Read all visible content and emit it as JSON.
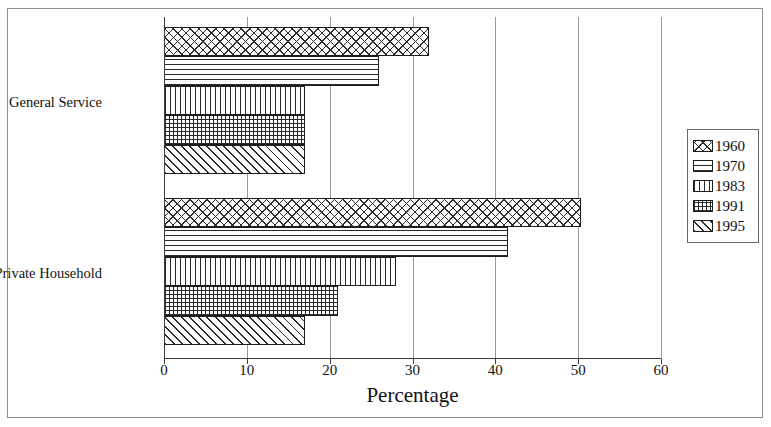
{
  "chart_data": {
    "type": "bar",
    "orientation": "horizontal",
    "title": "",
    "xlabel": "Percentage",
    "ylabel": "",
    "xlim": [
      0,
      60
    ],
    "xticks": [
      0,
      10,
      20,
      30,
      40,
      50,
      60
    ],
    "categories": [
      "General Service",
      "Private Household"
    ],
    "grid": true,
    "legend_position": "right",
    "series": [
      {
        "name": "1960",
        "pattern": "diagonal-crosshatch",
        "values": [
          32.0,
          50.3
        ]
      },
      {
        "name": "1970",
        "pattern": "horizontal-lines",
        "values": [
          26.0,
          41.5
        ]
      },
      {
        "name": "1983",
        "pattern": "vertical-lines",
        "values": [
          17.0,
          28.0
        ]
      },
      {
        "name": "1991",
        "pattern": "grid-crosshatch",
        "values": [
          17.0,
          21.0
        ]
      },
      {
        "name": "1995",
        "pattern": "diagonal-stripes",
        "values": [
          17.0,
          17.0
        ]
      }
    ]
  }
}
